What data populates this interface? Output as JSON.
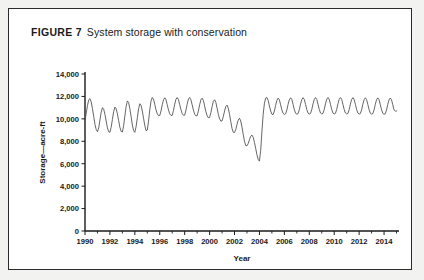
{
  "figure": {
    "label": "FIGURE 7",
    "caption": "System storage with conservation"
  },
  "chart_data": {
    "type": "line",
    "title": "System storage with conservation",
    "xlabel": "Year",
    "ylabel": "Storage—acre-ft",
    "xlim": [
      1990,
      2015.2
    ],
    "ylim": [
      0,
      14000
    ],
    "grid": false,
    "legend": null,
    "y_ticks": [
      0,
      2000,
      4000,
      6000,
      8000,
      10000,
      12000,
      14000
    ],
    "y_tick_labels": [
      "0",
      "2,000",
      "4,000",
      "6,000",
      "8,000",
      "10,000",
      "12,000",
      "14,000"
    ],
    "x_ticks": [
      1990,
      1992,
      1994,
      1996,
      1998,
      2000,
      2002,
      2004,
      2006,
      2008,
      2010,
      2012,
      2014
    ],
    "x_tick_labels": [
      "1990",
      "1992",
      "1994",
      "1996",
      "1998",
      "2000",
      "2002",
      "2004",
      "2006",
      "2008",
      "2010",
      "2012",
      "2014"
    ],
    "x_minor_tick_interval": 1,
    "series": [
      {
        "name": "System storage",
        "color": "#4a4a4a",
        "x": [
          1990.0,
          1990.1,
          1990.2,
          1990.3,
          1990.4,
          1990.5,
          1990.6,
          1990.7,
          1990.8,
          1990.9,
          1991.0,
          1991.1,
          1991.2,
          1991.3,
          1991.4,
          1991.5,
          1991.6,
          1991.7,
          1991.8,
          1991.9,
          1992.0,
          1992.1,
          1992.2,
          1992.3,
          1992.4,
          1992.5,
          1992.6,
          1992.7,
          1992.8,
          1992.9,
          1993.0,
          1993.1,
          1993.2,
          1993.3,
          1993.4,
          1993.5,
          1993.6,
          1993.7,
          1993.8,
          1993.9,
          1994.0,
          1994.1,
          1994.2,
          1994.3,
          1994.4,
          1994.5,
          1994.6,
          1994.7,
          1994.8,
          1994.9,
          1995.0,
          1995.1,
          1995.2,
          1995.3,
          1995.4,
          1995.5,
          1995.6,
          1995.7,
          1995.8,
          1995.9,
          1996.0,
          1996.1,
          1996.2,
          1996.3,
          1996.4,
          1996.5,
          1996.6,
          1996.7,
          1996.8,
          1996.9,
          1997.0,
          1997.1,
          1997.2,
          1997.3,
          1997.4,
          1997.5,
          1997.6,
          1997.7,
          1997.8,
          1997.9,
          1998.0,
          1998.1,
          1998.2,
          1998.3,
          1998.4,
          1998.5,
          1998.6,
          1998.7,
          1998.8,
          1998.9,
          1999.0,
          1999.1,
          1999.2,
          1999.3,
          1999.4,
          1999.5,
          1999.6,
          1999.7,
          1999.8,
          1999.9,
          2000.0,
          2000.1,
          2000.2,
          2000.3,
          2000.4,
          2000.5,
          2000.6,
          2000.7,
          2000.8,
          2000.9,
          2001.0,
          2001.1,
          2001.2,
          2001.3,
          2001.4,
          2001.5,
          2001.6,
          2001.7,
          2001.8,
          2001.9,
          2002.0,
          2002.1,
          2002.2,
          2002.3,
          2002.4,
          2002.5,
          2002.6,
          2002.7,
          2002.8,
          2002.9,
          2003.0,
          2003.1,
          2003.2,
          2003.3,
          2003.4,
          2003.5,
          2003.6,
          2003.7,
          2003.8,
          2003.9,
          2004.0,
          2004.1,
          2004.2,
          2004.3,
          2004.4,
          2004.5,
          2004.6,
          2004.7,
          2004.8,
          2004.9,
          2005.0,
          2005.1,
          2005.2,
          2005.3,
          2005.4,
          2005.5,
          2005.6,
          2005.7,
          2005.8,
          2005.9,
          2006.0,
          2006.1,
          2006.2,
          2006.3,
          2006.4,
          2006.5,
          2006.6,
          2006.7,
          2006.8,
          2006.9,
          2007.0,
          2007.1,
          2007.2,
          2007.3,
          2007.4,
          2007.5,
          2007.6,
          2007.7,
          2007.8,
          2007.9,
          2008.0,
          2008.1,
          2008.2,
          2008.3,
          2008.4,
          2008.5,
          2008.6,
          2008.7,
          2008.8,
          2008.9,
          2009.0,
          2009.1,
          2009.2,
          2009.3,
          2009.4,
          2009.5,
          2009.6,
          2009.7,
          2009.8,
          2009.9,
          2010.0,
          2010.1,
          2010.2,
          2010.3,
          2010.4,
          2010.5,
          2010.6,
          2010.7,
          2010.8,
          2010.9,
          2011.0,
          2011.1,
          2011.2,
          2011.3,
          2011.4,
          2011.5,
          2011.6,
          2011.7,
          2011.8,
          2011.9,
          2012.0,
          2012.1,
          2012.2,
          2012.3,
          2012.4,
          2012.5,
          2012.6,
          2012.7,
          2012.8,
          2012.9,
          2013.0,
          2013.1,
          2013.2,
          2013.3,
          2013.4,
          2013.5,
          2013.6,
          2013.7,
          2013.8,
          2013.9,
          2014.0,
          2014.1,
          2014.2,
          2014.3,
          2014.4,
          2014.5,
          2014.6,
          2014.7,
          2014.8,
          2014.9,
          2015.0
        ],
        "values": [
          9900,
          10500,
          11200,
          11700,
          11800,
          11500,
          10900,
          10200,
          9500,
          9050,
          8850,
          9200,
          9900,
          10600,
          11000,
          10850,
          10400,
          9800,
          9200,
          8850,
          8800,
          9250,
          9950,
          10650,
          11050,
          10900,
          10450,
          9850,
          9250,
          8880,
          8820,
          9400,
          10250,
          11100,
          11600,
          11450,
          10900,
          10200,
          9450,
          8950,
          8800,
          9300,
          10100,
          10900,
          11350,
          11200,
          10700,
          10050,
          9400,
          8950,
          9000,
          9800,
          10800,
          11600,
          11900,
          11750,
          11300,
          10800,
          10450,
          10280,
          10300,
          10700,
          11250,
          11700,
          11880,
          11700,
          11250,
          10800,
          10450,
          10300,
          10320,
          10750,
          11300,
          11750,
          11900,
          11720,
          11280,
          10820,
          10470,
          10320,
          10330,
          10760,
          11300,
          11760,
          11900,
          11700,
          11250,
          10780,
          10420,
          10260,
          10280,
          10700,
          11250,
          11700,
          11850,
          11650,
          11150,
          10650,
          10280,
          10100,
          10120,
          10550,
          11100,
          11550,
          11700,
          11480,
          10950,
          10400,
          10000,
          9800,
          9820,
          10200,
          10700,
          11100,
          11230,
          10950,
          10400,
          9750,
          9150,
          8800,
          8780,
          9050,
          9500,
          9900,
          10050,
          9800,
          9250,
          8600,
          8000,
          7620,
          7600,
          7800,
          8150,
          8450,
          8550,
          8350,
          7900,
          7350,
          6800,
          6380,
          6230,
          7200,
          8900,
          10400,
          11400,
          11850,
          11900,
          11650,
          11150,
          10700,
          10420,
          10380,
          10700,
          11200,
          11650,
          11850,
          11700,
          11250,
          10800,
          10480,
          10400,
          10450,
          10800,
          11300,
          11700,
          11880,
          11720,
          11280,
          10820,
          10500,
          10420,
          10470,
          10820,
          11320,
          11720,
          11890,
          11730,
          11290,
          10830,
          10510,
          10430,
          10480,
          10830,
          11330,
          11730,
          11900,
          11740,
          11300,
          10840,
          10520,
          10440,
          10490,
          10840,
          11340,
          11740,
          11900,
          11740,
          11300,
          10840,
          10520,
          10440,
          10490,
          10840,
          11340,
          11740,
          11900,
          11740,
          11300,
          10840,
          10520,
          10440,
          10480,
          10820,
          11320,
          11720,
          11890,
          11730,
          11290,
          10830,
          10510,
          10430,
          10470,
          10810,
          11310,
          11710,
          11880,
          11720,
          11280,
          10820,
          10500,
          10420,
          10460,
          10800,
          11300,
          11700,
          11870,
          11710,
          11270,
          10810,
          10490,
          10410,
          10450,
          10790,
          11290,
          11690,
          11860,
          11700,
          11260,
          10800,
          10700,
          10700
        ],
        "annotations": {
          "minimum_value": 6230,
          "minimum_year": 2004.0,
          "maximum_value": 11900
        }
      }
    ]
  }
}
